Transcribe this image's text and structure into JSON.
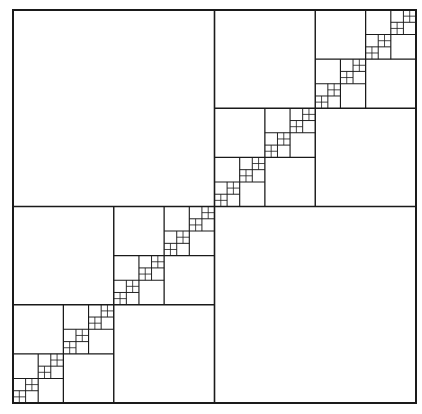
{
  "diagram": {
    "type": "fractal-quadtree",
    "canvas": {
      "width": 422,
      "height": 414,
      "background": "#ffffff"
    },
    "outer_square": {
      "x": 13,
      "y": 10,
      "width": 403,
      "height": 393
    },
    "rule": {
      "split": "quadrants",
      "empty_quadrants": [
        "top-left",
        "bottom-right"
      ],
      "recursed_quadrants": [
        "bottom-left",
        "top-right"
      ]
    },
    "recursion_depth": 6,
    "stroke": {
      "color": "#1a1a1a",
      "outer_width": 2,
      "inner_width_max": 1.6,
      "inner_width_min": 0.8
    }
  }
}
